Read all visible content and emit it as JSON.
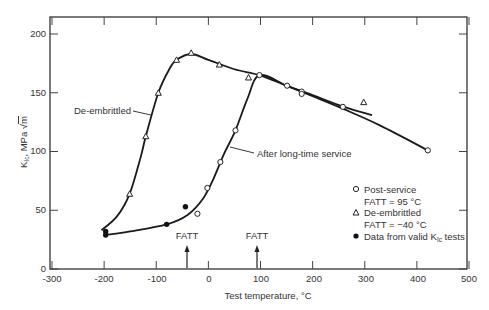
{
  "chart_data": {
    "type": "scatter",
    "title": "",
    "xlabel": "Test temperature, °C",
    "ylabel": "K_Ic, MPa √m",
    "xlim": [
      -300,
      500
    ],
    "ylim": [
      0,
      215
    ],
    "xticks": [
      -300,
      -200,
      -100,
      0,
      100,
      200,
      300,
      400,
      500
    ],
    "yticks": [
      0,
      50,
      100,
      150,
      200
    ],
    "grid": false,
    "legend_position": "lower right (inside)",
    "series": [
      {
        "name": "Post-service FATT = 95 °C",
        "marker": "open-circle",
        "points": [
          [
            -21,
            47
          ],
          [
            -2,
            69
          ],
          [
            23,
            91
          ],
          [
            52,
            118
          ],
          [
            98,
            165
          ],
          [
            151,
            156
          ],
          [
            179,
            151
          ],
          [
            179,
            149
          ],
          [
            258,
            138
          ],
          [
            421,
            101
          ]
        ]
      },
      {
        "name": "De-embrittled FATT = -40 °C",
        "marker": "open-triangle",
        "points": [
          [
            -151,
            64
          ],
          [
            -120,
            113
          ],
          [
            -96,
            150
          ],
          [
            -61,
            178
          ],
          [
            -33,
            184
          ],
          [
            21,
            174
          ],
          [
            77,
            163
          ],
          [
            298,
            142
          ]
        ]
      },
      {
        "name": "Data from valid K_Ic tests",
        "marker": "filled-circle",
        "points": [
          [
            -197,
            29
          ],
          [
            -197,
            32
          ],
          [
            -80,
            38
          ],
          [
            -44,
            53
          ]
        ]
      }
    ],
    "curves": [
      {
        "name": "De-embrittled",
        "points": [
          [
            -205,
            33
          ],
          [
            -175,
            45
          ],
          [
            -151,
            64
          ],
          [
            -130,
            95
          ],
          [
            -120,
            113
          ],
          [
            -96,
            150
          ],
          [
            -75,
            170
          ],
          [
            -61,
            178
          ],
          [
            -33,
            183
          ],
          [
            0,
            178
          ],
          [
            50,
            170
          ],
          [
            98,
            165
          ],
          [
            150,
            156
          ],
          [
            200,
            148
          ],
          [
            260,
            138
          ],
          [
            314,
            131
          ]
        ]
      },
      {
        "name": "After long-time service",
        "points": [
          [
            -197,
            29
          ],
          [
            -150,
            32
          ],
          [
            -80,
            38
          ],
          [
            -40,
            46
          ],
          [
            -10,
            60
          ],
          [
            10,
            77
          ],
          [
            30,
            98
          ],
          [
            52,
            118
          ],
          [
            75,
            145
          ],
          [
            98,
            165
          ],
          [
            150,
            156
          ],
          [
            200,
            147
          ],
          [
            260,
            136
          ],
          [
            330,
            122
          ],
          [
            421,
            101
          ]
        ]
      }
    ],
    "annotations": [
      {
        "text": "De-embrittled",
        "x": -215,
        "y": 127
      },
      {
        "text": "After long-time service",
        "x": 80,
        "y": 105
      },
      {
        "text": "FATT",
        "x": -40,
        "y": 30,
        "arrow_to_x": -40
      },
      {
        "text": "FATT",
        "x": 95,
        "y": 30,
        "arrow_to_x": 95
      }
    ]
  },
  "labels": {
    "xlabel": "Test temperature, °C",
    "ylabel_main": "K",
    "ylabel_sub": "Ic",
    "ylabel_rest": ", MPa ",
    "ylabel_root": "m",
    "annot_deembrittled": "De-embrittled",
    "annot_service": "After long-time service",
    "fatt_left": "FATT",
    "fatt_right": "FATT",
    "xticks": [
      "-300",
      "-200",
      "-100",
      "0",
      "100",
      "200",
      "300",
      "400",
      "500"
    ],
    "yticks": [
      "0",
      "50",
      "100",
      "150",
      "200"
    ]
  },
  "legend": {
    "post_service_1": "Post-service",
    "post_service_2": "FATT = 95 °C",
    "deembrittled_1": "De-embrittled",
    "deembrittled_2": "FATT = −40 °C",
    "valid_main": "Data from valid K",
    "valid_sub": "Ic",
    "valid_rest": " tests"
  }
}
